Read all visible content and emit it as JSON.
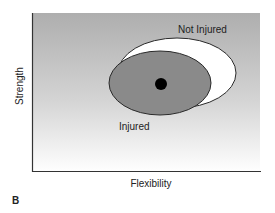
{
  "figure": {
    "panel_label": "B",
    "xlabel": "Flexibility",
    "ylabel": "Strength",
    "colors": {
      "bg_top": "#aeaeae",
      "bg_bottom": "#ffffff",
      "injured_fill": "#8a8a8a",
      "not_injured_fill": "#ffffff",
      "outline": "#2a2a2a",
      "centroid": "#000000",
      "axis": "#333333",
      "text": "#222222"
    },
    "regions": [
      {
        "label": "Not Injured",
        "cx": 177,
        "cy": 73,
        "rx": 59,
        "ry": 35,
        "fill_key": "not_injured_fill"
      },
      {
        "label": "Injured",
        "cx": 160,
        "cy": 83,
        "rx": 51,
        "ry": 32,
        "fill_key": "injured_fill"
      }
    ],
    "centroid": {
      "cx": 161,
      "cy": 84,
      "r": 6
    }
  },
  "chart_data": {
    "type": "scatter",
    "title": "",
    "xlabel": "Flexibility",
    "ylabel": "Strength",
    "grid": false,
    "legend": "direct labels",
    "series": [
      {
        "name": "Not Injured",
        "shape": "ellipse",
        "relative_center": [
          0.63,
          0.62
        ],
        "relative_radii": [
          0.26,
          0.22
        ]
      },
      {
        "name": "Injured",
        "shape": "ellipse",
        "relative_center": [
          0.56,
          0.56
        ],
        "relative_radii": [
          0.22,
          0.2
        ]
      }
    ],
    "annotations": [
      "Not Injured",
      "Injured",
      "B"
    ]
  }
}
